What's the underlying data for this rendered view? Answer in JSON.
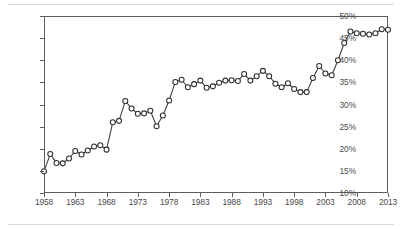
{
  "chart_data": {
    "type": "line",
    "title": "",
    "subtitle": "",
    "xlabel": "",
    "ylabel": "",
    "xlim": [
      1958,
      2013
    ],
    "ylim": [
      10,
      50
    ],
    "grid": true,
    "legend": null,
    "y_tick_labels": [
      "10%",
      "15%",
      "20%",
      "25%",
      "30%",
      "35%",
      "40%",
      "45%",
      "50%"
    ],
    "y_tick_values": [
      10,
      15,
      20,
      25,
      30,
      35,
      40,
      45,
      50
    ],
    "x_tick_labels": [
      "1958",
      "1963",
      "1968",
      "1973",
      "1978",
      "1983",
      "1988",
      "1993",
      "1998",
      "2003",
      "2008",
      "2013"
    ],
    "x_tick_values": [
      1958,
      1963,
      1968,
      1973,
      1978,
      1983,
      1988,
      1993,
      1998,
      2003,
      2008,
      2013
    ],
    "marker": "open-circle",
    "x": [
      1958,
      1959,
      1960,
      1961,
      1962,
      1963,
      1964,
      1965,
      1966,
      1967,
      1968,
      1969,
      1970,
      1971,
      1972,
      1973,
      1974,
      1975,
      1976,
      1977,
      1978,
      1979,
      1980,
      1981,
      1982,
      1983,
      1984,
      1985,
      1986,
      1987,
      1988,
      1989,
      1990,
      1991,
      1992,
      1993,
      1994,
      1995,
      1996,
      1997,
      1998,
      1999,
      2000,
      2001,
      2002,
      2003,
      2004,
      2005,
      2006,
      2007,
      2008,
      2009,
      2010,
      2011,
      2012,
      2013
    ],
    "values": [
      14.9,
      18.8,
      16.8,
      16.7,
      17.8,
      19.5,
      18.7,
      19.6,
      20.5,
      20.8,
      19.8,
      26.0,
      26.3,
      30.8,
      29.1,
      27.9,
      28.0,
      28.6,
      25.1,
      27.5,
      30.9,
      35.1,
      35.6,
      33.9,
      34.6,
      35.4,
      33.8,
      34.1,
      34.9,
      35.4,
      35.5,
      35.3,
      36.9,
      35.4,
      36.4,
      37.6,
      36.4,
      34.7,
      33.9,
      34.8,
      33.5,
      32.8,
      32.8,
      36.0,
      38.7,
      37.0,
      36.6,
      40.0,
      43.9,
      46.5,
      46.1,
      46.0,
      45.8,
      46.1,
      47.0,
      46.9
    ],
    "series_name": "percentage"
  }
}
